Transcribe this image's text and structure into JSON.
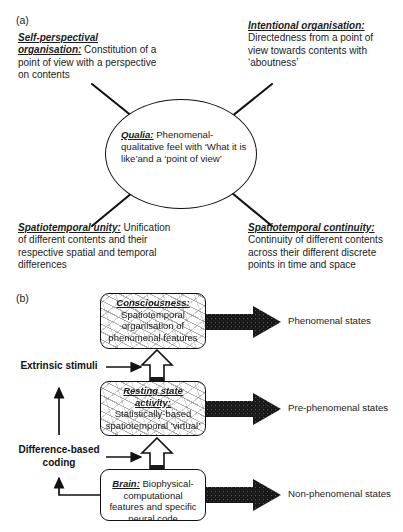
{
  "panels": {
    "a_label": "(a)",
    "b_label": "(b)"
  },
  "panel_a": {
    "center_node": {
      "term": "Qualia:",
      "body": " Phenomenal-qualitative feel with ‘What it is like’and a ‘point of view’"
    },
    "corners": [
      {
        "position": "top-left",
        "term": "Self-perspectival organisation:",
        "body": " Constitution of a point of view with a perspective on contents"
      },
      {
        "position": "top-right",
        "term": "Intentional organisation:",
        "body": " Directedness from a point of view towards contents with ‘aboutness’"
      },
      {
        "position": "bottom-left",
        "term": "Spatiotemporal unity:",
        "body": " Unification of different contents and their respective spatial and temporal differences"
      },
      {
        "position": "bottom-right",
        "term": "Spatiotemporal continuity:",
        "body": " Continuity of different contents across their different discrete points in time and space"
      }
    ]
  },
  "panel_b": {
    "levels": [
      {
        "id": "consciousness",
        "term": "Consciousness:",
        "body": "Spatiotemporal organisation of phenomenal features",
        "output": "Phenomenal states"
      },
      {
        "id": "resting-state-activity",
        "term": "Resting state activity:",
        "body": "Statistically-based spatiotemporal ‘virtual’ structure",
        "output": "Pre-phenomenal states"
      },
      {
        "id": "brain",
        "term": "Brain:",
        "body": " Biophysical-computational features and specific neural code",
        "output": "Non-phenomenal states"
      }
    ],
    "inputs": [
      {
        "id": "extrinsic-stimuli",
        "label": "Extrinsic stimuli"
      },
      {
        "id": "difference-based-coding",
        "label": "Difference-based coding"
      }
    ]
  },
  "colors": {
    "ink": "#1a1a1a",
    "stroke": "#111111",
    "arrow_fill": "#161616",
    "background": "#ffffff"
  }
}
